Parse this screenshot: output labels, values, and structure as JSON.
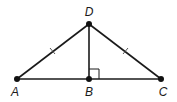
{
  "diagram": {
    "points": {
      "A": {
        "label": "A",
        "x": 17,
        "y": 79
      },
      "B": {
        "label": "B",
        "x": 89,
        "y": 79
      },
      "C": {
        "label": "C",
        "x": 161,
        "y": 79
      },
      "D": {
        "label": "D",
        "x": 89,
        "y": 24
      }
    },
    "segments": [
      {
        "from": "A",
        "to": "D",
        "tick_marks": 1
      },
      {
        "from": "D",
        "to": "C",
        "tick_marks": 1
      },
      {
        "from": "D",
        "to": "B",
        "tick_marks": 0
      },
      {
        "from": "A",
        "to": "C",
        "tick_marks": 0
      }
    ],
    "right_angle": {
      "vertex": "B",
      "between": [
        "D",
        "C"
      ]
    },
    "colors": {
      "line": "#1a1a1a",
      "point": "#111111",
      "background": "#ffffff"
    }
  }
}
